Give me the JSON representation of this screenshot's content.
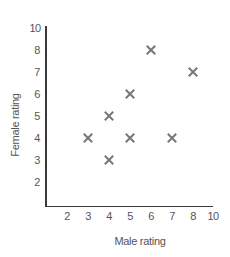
{
  "chart_data": {
    "type": "scatter",
    "title": "",
    "xlabel": "Male rating",
    "ylabel": "Female rating",
    "x_ticks": [
      "2",
      "3",
      "4",
      "5",
      "6",
      "7",
      "8",
      "10"
    ],
    "y_ticks": [
      "10",
      "8",
      "7",
      "6",
      "5",
      "4",
      "3",
      "2"
    ],
    "xlim": [
      1,
      9
    ],
    "ylim": [
      1,
      9
    ],
    "grid": false,
    "legend": null,
    "marker": "x",
    "marker_color": "#777777",
    "points": [
      {
        "x": 6,
        "y": 8
      },
      {
        "x": 8,
        "y": 7
      },
      {
        "x": 5,
        "y": 6
      },
      {
        "x": 4,
        "y": 5
      },
      {
        "x": 3,
        "y": 4
      },
      {
        "x": 5,
        "y": 4
      },
      {
        "x": 7,
        "y": 4
      },
      {
        "x": 4,
        "y": 3
      }
    ]
  },
  "axes": {
    "x_title": "Male rating",
    "y_title": "Female rating"
  }
}
